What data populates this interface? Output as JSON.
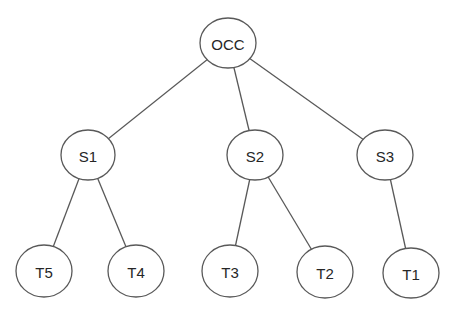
{
  "diagram": {
    "type": "tree",
    "colors": {
      "background": "#ffffff",
      "stroke": "#595959",
      "text": "#262626"
    },
    "nodes": [
      {
        "id": "OCC",
        "label": "OCC",
        "cx": 228,
        "cy": 43,
        "rx": 28,
        "ry": 25
      },
      {
        "id": "S1",
        "label": "S1",
        "cx": 88,
        "cy": 155,
        "rx": 27,
        "ry": 25
      },
      {
        "id": "S2",
        "label": "S2",
        "cx": 255,
        "cy": 155,
        "rx": 28,
        "ry": 25
      },
      {
        "id": "S3",
        "label": "S3",
        "cx": 385,
        "cy": 155,
        "rx": 28,
        "ry": 25
      },
      {
        "id": "T5",
        "label": "T5",
        "cx": 44,
        "cy": 271,
        "rx": 28,
        "ry": 26
      },
      {
        "id": "T4",
        "label": "T4",
        "cx": 136,
        "cy": 271,
        "rx": 28,
        "ry": 26
      },
      {
        "id": "T3",
        "label": "T3",
        "cx": 230,
        "cy": 271,
        "rx": 28,
        "ry": 26
      },
      {
        "id": "T2",
        "label": "T2",
        "cx": 325,
        "cy": 272,
        "rx": 28,
        "ry": 26
      },
      {
        "id": "T1",
        "label": "T1",
        "cx": 411,
        "cy": 273,
        "rx": 28,
        "ry": 25
      }
    ],
    "edges": [
      {
        "from": "OCC",
        "to": "S1"
      },
      {
        "from": "OCC",
        "to": "S2"
      },
      {
        "from": "OCC",
        "to": "S3"
      },
      {
        "from": "S1",
        "to": "T5"
      },
      {
        "from": "S1",
        "to": "T4"
      },
      {
        "from": "S2",
        "to": "T3"
      },
      {
        "from": "S2",
        "to": "T2"
      },
      {
        "from": "S3",
        "to": "T1"
      }
    ]
  }
}
